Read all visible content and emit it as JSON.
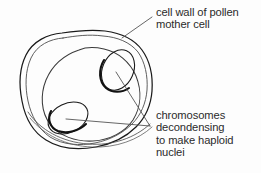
{
  "figure": {
    "background_color": "#fdfdfd",
    "ink_color": "#1a1a1a",
    "text_color": "#2b2b2b"
  },
  "labels": {
    "cell_wall": {
      "name": "cell wall of pollen mother cell",
      "lines": [
        "cell wall of pollen",
        "mother cell"
      ]
    },
    "chromosomes": {
      "name": "chromosomes decondensing to make haploid nuclei",
      "lines": [
        "chromosomes",
        "decondensing",
        "to make haploid",
        "nuclei"
      ]
    }
  },
  "diagram_parts": {
    "outer_cell_wall": "double-contour rounded blob outline",
    "inner_cell_membrane": "single rounded contour inside the wall",
    "nucleus_upper_right": "tilted ellipse with thickened lower-left edge",
    "nucleus_lower_left": "tilted ellipse with thickened lower-left edge",
    "leader_cell_wall": "line from label to upper cell wall",
    "leader_nucleus_upper": "line from label vertex to upper-right nucleus",
    "leader_nucleus_lower": "line from label vertex to lower-left nucleus"
  }
}
